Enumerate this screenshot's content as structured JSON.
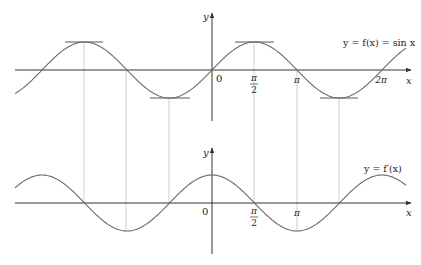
{
  "figure": {
    "top_graph": {
      "function_label": "y = f(x) = sin x",
      "y_axis_label": "y",
      "x_axis_label": "x",
      "origin_label": "0",
      "tick_labels": [
        {
          "id": "pi_over_2",
          "num": "π",
          "den": "2"
        },
        {
          "id": "pi",
          "text": "π"
        },
        {
          "id": "two_pi",
          "text": "2π"
        }
      ],
      "tangent_points": [
        "-3π/2",
        "-π/2",
        "π/2",
        "3π/2"
      ]
    },
    "bottom_graph": {
      "function_label": "y = f′(x)",
      "y_axis_label": "y",
      "x_axis_label": "x",
      "origin_label": "0",
      "tick_labels": [
        {
          "id": "pi_over_2",
          "num": "π",
          "den": "2"
        },
        {
          "id": "pi",
          "text": "π"
        }
      ]
    },
    "connector_x_values": [
      "-3π/2",
      "-π",
      "-π/2",
      "π/2",
      "π",
      "3π/2"
    ],
    "colors": {
      "curve": "#6b6b6b",
      "axis": "#333333",
      "connector": "#c4c4c4",
      "tangent": "#555555",
      "text": "#222222"
    }
  }
}
